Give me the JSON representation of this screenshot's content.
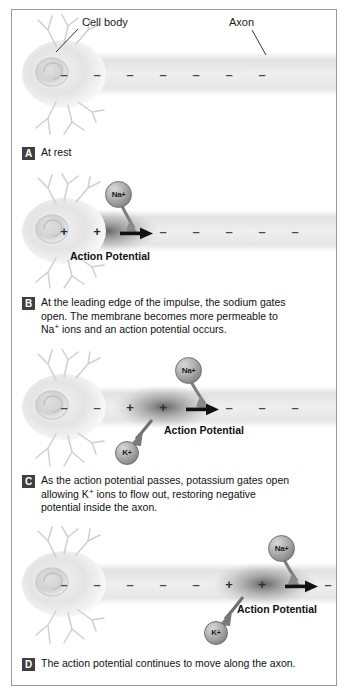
{
  "figure": {
    "background_color": "#ffffff",
    "border_color": "#9a9a9a"
  },
  "annotations": {
    "cell_body_label": "Cell body",
    "axon_label": "Axon",
    "action_potential_label": "Action Potential",
    "sodium_ion_label": "Na",
    "sodium_ion_charge": "+",
    "potassium_ion_label": "K",
    "potassium_ion_charge": "+"
  },
  "panels": [
    {
      "badge": "A",
      "caption": "At rest",
      "caption_lines": [
        "At rest"
      ],
      "charges": [
        "-",
        "-",
        "-",
        "-",
        "-",
        "-",
        "-"
      ],
      "has_sodium_ion": false,
      "has_potassium_ion": false,
      "has_arrow": false,
      "has_action_potential_label": false,
      "show_cell_body_label": true,
      "show_axon_label": true
    },
    {
      "badge": "B",
      "caption": "At the leading edge of the impulse, the sodium gates open.  The membrane becomes more permeable to Na+ ions and an action potential occurs.",
      "caption_lines": [
        "At the leading edge of the impulse, the sodium gates",
        "open.  The membrane becomes more permeable to",
        "Na+ ions and an action potential occurs."
      ],
      "charges": [
        "+",
        "+",
        "ARROW",
        "-",
        "-",
        "-",
        "-",
        "-"
      ],
      "has_sodium_ion": true,
      "has_potassium_ion": false,
      "has_arrow": true,
      "has_action_potential_label": true,
      "show_cell_body_label": false,
      "show_axon_label": false
    },
    {
      "badge": "C",
      "caption": "As the action potential passes, potassium gates open allowing K+ ions to flow out, restoring negative potential inside the axon.",
      "caption_lines": [
        "As the action potential passes, potassium gates open",
        "allowing K+ ions to flow out, restoring negative",
        "potential inside the axon."
      ],
      "charges": [
        "-",
        "-",
        "+",
        "+",
        "ARROW",
        "-",
        "-",
        "-"
      ],
      "has_sodium_ion": true,
      "has_potassium_ion": true,
      "has_arrow": true,
      "has_action_potential_label": true,
      "show_cell_body_label": false,
      "show_axon_label": false
    },
    {
      "badge": "D",
      "caption": "The action potential continues to move along the axon.",
      "caption_lines": [
        "The action potential continues to move along the axon."
      ],
      "charges": [
        "-",
        "-",
        "-",
        "-",
        "-",
        "+",
        "+",
        "ARROW",
        "-"
      ],
      "has_sodium_ion": true,
      "has_potassium_ion": true,
      "has_arrow": true,
      "has_action_potential_label": true,
      "show_cell_body_label": false,
      "show_axon_label": false
    }
  ]
}
